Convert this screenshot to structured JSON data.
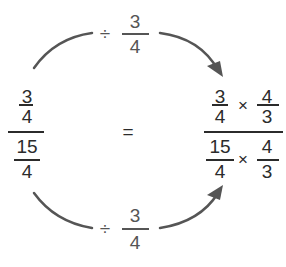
{
  "top_operation": {
    "symbol": "÷",
    "numerator": "3",
    "denominator": "4"
  },
  "bottom_operation": {
    "symbol": "÷",
    "numerator": "3",
    "denominator": "4"
  },
  "left_expression": {
    "top_fraction": {
      "numerator": "3",
      "denominator": "4"
    },
    "bottom_fraction": {
      "numerator": "15",
      "denominator": "4"
    }
  },
  "equals": "=",
  "right_expression": {
    "top": {
      "fraction1": {
        "numerator": "3",
        "denominator": "4"
      },
      "operator": "×",
      "fraction2": {
        "numerator": "4",
        "denominator": "3"
      }
    },
    "bottom": {
      "fraction1": {
        "numerator": "15",
        "denominator": "4"
      },
      "operator": "×",
      "fraction2": {
        "numerator": "4",
        "denominator": "3"
      }
    }
  },
  "colors": {
    "text": "#2b2b2b",
    "arrow": "#555555",
    "label": "#555555"
  }
}
